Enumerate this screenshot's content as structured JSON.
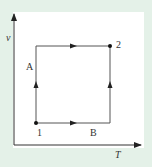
{
  "diagram": {
    "type": "thermodynamic-process-diagram",
    "axes": {
      "x_label": "T",
      "y_label": "v"
    },
    "states": [
      {
        "id": "1",
        "label": "1"
      },
      {
        "id": "2",
        "label": "2"
      }
    ],
    "paths": [
      {
        "label": "A",
        "description": "constant T (vertical) from 1 up, then constant v to 2"
      },
      {
        "label": "B",
        "description": "constant v from 1 right, then constant T up to 2"
      }
    ],
    "colors": {
      "background": "#e4f1e8",
      "panel": "#ffffff",
      "line": "#444444"
    }
  }
}
